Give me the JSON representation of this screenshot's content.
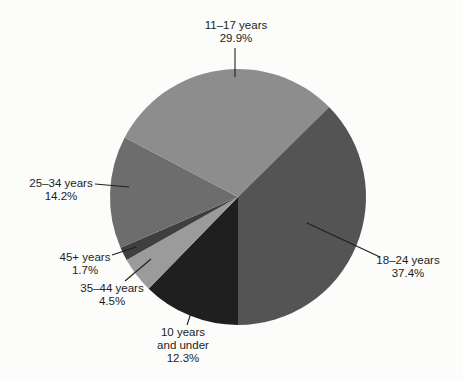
{
  "figure": {
    "background_color": "#fcfcfb",
    "text_color": "#1c1c1c"
  },
  "chart_data": {
    "type": "pie",
    "title": "",
    "unit": "percent",
    "total": 100.0,
    "start_angle_deg_from_top_clockwise": 180,
    "direction": "clockwise",
    "legend": "none (external labels with leader lines)",
    "slices": [
      {
        "id": "under10",
        "label_lines": [
          "10 years",
          "and under"
        ],
        "value": 12.3,
        "value_label": "12.3%",
        "color": "#1f1f1f"
      },
      {
        "id": "a35-44",
        "label_lines": [
          "35–44 years"
        ],
        "value": 4.5,
        "value_label": "4.5%",
        "color": "#9b9b9b"
      },
      {
        "id": "a45plus",
        "label_lines": [
          "45+ years"
        ],
        "value": 1.7,
        "value_label": "1.7%",
        "color": "#3f3f3f"
      },
      {
        "id": "a25-34",
        "label_lines": [
          "25–34 years"
        ],
        "value": 14.2,
        "value_label": "14.2%",
        "color": "#6d6d6d"
      },
      {
        "id": "a11-17",
        "label_lines": [
          "11–17 years"
        ],
        "value": 29.9,
        "value_label": "29.9%",
        "color": "#8d8d8d"
      },
      {
        "id": "a18-24",
        "label_lines": [
          "18–24 years"
        ],
        "value": 37.4,
        "value_label": "37.4%",
        "color": "#545454"
      }
    ]
  }
}
